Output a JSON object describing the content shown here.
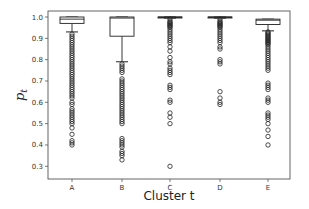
{
  "chart_data": {
    "type": "boxplot",
    "title": "",
    "xlabel": "Cluster t",
    "ylabel": "p_t",
    "ylabel_main": "p",
    "ylabel_sub": "t",
    "ylim": [
      0.28,
      1.01
    ],
    "yticks": [
      0.3,
      0.4,
      0.5,
      0.6,
      0.7,
      0.8,
      0.9,
      1.0
    ],
    "ytick_labels": [
      "0.3",
      "0.4",
      "0.5",
      "0.6",
      "0.7",
      "0.8",
      "0.9",
      "1.0"
    ],
    "categories": [
      "A",
      "B",
      "C",
      "D",
      "E"
    ],
    "grid": false,
    "legend": null,
    "boxes": [
      {
        "category": "A",
        "whisker_low": 0.93,
        "q1": 0.97,
        "median": 0.99,
        "q3": 1.0,
        "whisker_high": 1.0,
        "outliers": [
          0.92,
          0.91,
          0.9,
          0.89,
          0.88,
          0.87,
          0.86,
          0.85,
          0.84,
          0.83,
          0.82,
          0.81,
          0.8,
          0.79,
          0.78,
          0.77,
          0.76,
          0.75,
          0.74,
          0.73,
          0.72,
          0.71,
          0.7,
          0.69,
          0.68,
          0.67,
          0.66,
          0.65,
          0.64,
          0.63,
          0.62,
          0.6,
          0.59,
          0.57,
          0.56,
          0.55,
          0.54,
          0.53,
          0.52,
          0.51,
          0.5,
          0.48,
          0.45,
          0.42,
          0.41,
          0.4
        ]
      },
      {
        "category": "B",
        "whisker_low": 0.79,
        "q1": 0.91,
        "median": 0.995,
        "q3": 1.0,
        "whisker_high": 1.0,
        "outliers": [
          0.78,
          0.77,
          0.76,
          0.75,
          0.74,
          0.71,
          0.7,
          0.69,
          0.68,
          0.67,
          0.66,
          0.65,
          0.64,
          0.63,
          0.62,
          0.61,
          0.6,
          0.59,
          0.58,
          0.57,
          0.56,
          0.55,
          0.54,
          0.53,
          0.52,
          0.51,
          0.5,
          0.43,
          0.42,
          0.41,
          0.4,
          0.39,
          0.37,
          0.36,
          0.35,
          0.33
        ]
      },
      {
        "category": "C",
        "whisker_low": 0.995,
        "q1": 0.998,
        "median": 1.0,
        "q3": 1.0,
        "whisker_high": 1.0,
        "outliers": [
          0.99,
          0.98,
          0.975,
          0.97,
          0.965,
          0.96,
          0.955,
          0.95,
          0.94,
          0.93,
          0.92,
          0.91,
          0.9,
          0.89,
          0.88,
          0.86,
          0.84,
          0.81,
          0.79,
          0.78,
          0.76,
          0.75,
          0.74,
          0.73,
          0.68,
          0.67,
          0.66,
          0.61,
          0.6,
          0.55,
          0.53,
          0.5,
          0.3
        ]
      },
      {
        "category": "D",
        "whisker_low": 0.995,
        "q1": 0.998,
        "median": 1.0,
        "q3": 1.0,
        "whisker_high": 1.0,
        "outliers": [
          0.99,
          0.98,
          0.975,
          0.97,
          0.965,
          0.96,
          0.955,
          0.95,
          0.94,
          0.93,
          0.92,
          0.91,
          0.9,
          0.89,
          0.88,
          0.86,
          0.85,
          0.8,
          0.79,
          0.78,
          0.65,
          0.62,
          0.6,
          0.59
        ]
      },
      {
        "category": "E",
        "whisker_low": 0.935,
        "q1": 0.965,
        "median": 0.985,
        "q3": 0.99,
        "whisker_high": 0.99,
        "outliers": [
          0.93,
          0.925,
          0.92,
          0.915,
          0.91,
          0.905,
          0.9,
          0.895,
          0.89,
          0.885,
          0.88,
          0.875,
          0.87,
          0.86,
          0.85,
          0.84,
          0.83,
          0.82,
          0.81,
          0.8,
          0.79,
          0.78,
          0.77,
          0.76,
          0.75,
          0.69,
          0.68,
          0.67,
          0.66,
          0.62,
          0.61,
          0.6,
          0.55,
          0.54,
          0.53,
          0.52,
          0.5,
          0.47,
          0.44,
          0.4
        ]
      }
    ]
  }
}
